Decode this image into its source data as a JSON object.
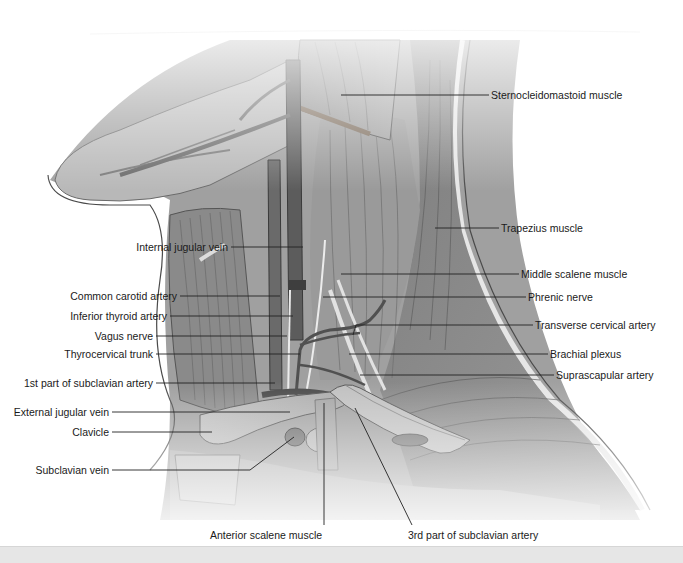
{
  "figure": {
    "colors": {
      "skin_outline": "#4a4a4a",
      "muscle_dark": "#6e6e6e",
      "muscle_mid": "#8c8c8c",
      "muscle_light": "#b5b5b5",
      "vessel": "#5a5a5a",
      "nerve": "#e8e8e8",
      "leader_line": "#222222",
      "label_text": "#1a1a1a"
    },
    "labels_left": [
      {
        "text": "Internal jugular vein",
        "x": 229,
        "y": 247,
        "target_x": 303,
        "target_y": 247
      },
      {
        "text": "Common carotid artery",
        "x": 178,
        "y": 296,
        "target_x": 280,
        "target_y": 296
      },
      {
        "text": "Inferior thyroid artery",
        "x": 168,
        "y": 316,
        "target_x": 293,
        "target_y": 316
      },
      {
        "text": "Vagus nerve",
        "x": 154,
        "y": 336,
        "target_x": 287,
        "target_y": 336
      },
      {
        "text": "Thyrocervical trunk",
        "x": 154,
        "y": 354,
        "target_x": 300,
        "target_y": 354
      },
      {
        "text": "1st part of subclavian artery",
        "x": 154,
        "y": 383,
        "target_x": 275,
        "target_y": 383
      },
      {
        "text": "External jugular vein",
        "x": 110,
        "y": 412,
        "target_x": 290,
        "target_y": 412
      },
      {
        "text": "Clavicle",
        "x": 110,
        "y": 432,
        "target_x": 212,
        "target_y": 432
      },
      {
        "text": "Subclavian vein",
        "x": 110,
        "y": 470,
        "target_x": 294,
        "target_y": 433
      }
    ],
    "labels_right": [
      {
        "text": "Sternocleidomastoid muscle",
        "x": 491,
        "y": 95,
        "target_x": 341,
        "target_y": 95
      },
      {
        "text": "Trapezius muscle",
        "x": 501,
        "y": 228,
        "target_x": 435,
        "target_y": 228
      },
      {
        "text": "Middle scalene muscle",
        "x": 521,
        "y": 274,
        "target_x": 341,
        "target_y": 274
      },
      {
        "text": "Phrenic nerve",
        "x": 528,
        "y": 297,
        "target_x": 323,
        "target_y": 297
      },
      {
        "text": "Transverse cervical artery",
        "x": 535,
        "y": 325,
        "target_x": 356,
        "target_y": 330
      },
      {
        "text": "Brachial plexus",
        "x": 550,
        "y": 354,
        "target_x": 349,
        "target_y": 354
      },
      {
        "text": "Suprascapular artery",
        "x": 556,
        "y": 375,
        "target_x": 360,
        "target_y": 375
      }
    ],
    "labels_bottom": [
      {
        "text": "Anterior scalene muscle",
        "x": 270,
        "y": 535,
        "target_x": 324,
        "target_y": 403
      },
      {
        "text": "3rd part of subclavian artery",
        "x": 478,
        "y": 535,
        "target_x": 355,
        "target_y": 408
      }
    ]
  }
}
